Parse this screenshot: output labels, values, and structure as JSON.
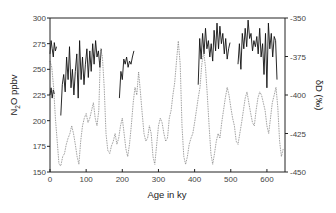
{
  "chart_data": {
    "type": "line",
    "title": "",
    "xlabel": "Age in ky",
    "ylabel": "N2O ppbv",
    "ylabel_right": "δD (‰)",
    "xlim": [
      0,
      650
    ],
    "ylim": [
      150,
      300
    ],
    "ylim_right": [
      -450,
      -350
    ],
    "x_ticks": [
      0,
      100,
      200,
      300,
      400,
      500,
      600
    ],
    "y_ticks": [
      150,
      175,
      200,
      225,
      250,
      275,
      300
    ],
    "y_ticks_right": [
      -350,
      -375,
      -400,
      -425,
      -450
    ],
    "grid": false,
    "legend": null,
    "series": [
      {
        "name": "N2O",
        "axis": "left",
        "style": "solid black",
        "segments": [
          {
            "x": [
              0,
              3,
              6,
              9,
              12,
              15,
              18
            ],
            "y": [
              265,
              278,
              270,
              262,
              276,
              268,
              272
            ]
          },
          {
            "x": [
              0,
              3,
              6,
              9,
              12
            ],
            "y": [
              225,
              232,
              222,
              230,
              226
            ]
          },
          {
            "x": [
              30,
              34,
              38,
              42,
              46,
              50,
              54,
              58,
              62,
              66,
              70,
              74,
              78,
              82,
              86,
              90,
              94,
              98,
              102,
              106,
              110,
              114,
              118,
              122,
              126,
              130,
              134,
              138,
              142
            ],
            "y": [
              205,
              235,
              245,
              228,
              262,
              240,
              272,
              232,
              250,
              225,
              248,
              265,
              222,
              278,
              240,
              262,
              235,
              255,
              270,
              242,
              268,
              248,
              275,
              255,
              278,
              262,
              268,
              252,
              270
            ]
          },
          {
            "x": [
              192,
              196,
              200,
              204,
              208,
              212,
              216,
              220,
              224,
              228,
              232
            ],
            "y": [
              222,
              248,
              240,
              260,
              255,
              262,
              252,
              258,
              255,
              262,
              268
            ]
          },
          {
            "x": [
              410,
              414,
              418,
              422,
              426,
              430,
              434,
              438,
              442,
              446,
              450,
              454,
              458,
              462,
              466,
              470,
              474,
              478,
              482,
              486,
              490,
              494,
              498
            ],
            "y": [
              235,
              280,
              260,
              285,
              265,
              290,
              270,
              278,
              262,
              275,
              258,
              288,
              268,
              295,
              270,
              292,
              275,
              285,
              265,
              280,
              260,
              270,
              276
            ]
          },
          {
            "x": [
              520,
              524,
              528,
              532,
              536,
              540,
              544,
              548,
              552,
              556,
              560,
              564,
              568,
              572,
              576,
              580,
              584,
              588,
              592,
              596,
              600,
              604,
              608,
              612,
              616,
              620,
              624,
              628
            ],
            "y": [
              255,
              275,
              250,
              285,
              270,
              290,
              272,
              298,
              280,
              285,
              268,
              278,
              272,
              282,
              265,
              290,
              262,
              275,
              245,
              285,
              232,
              295,
              270,
              285,
              262,
              282,
              278,
              240
            ]
          }
        ]
      },
      {
        "name": "δD",
        "axis": "right",
        "style": "dotted grey",
        "x": [
          0,
          5,
          10,
          15,
          20,
          25,
          30,
          35,
          40,
          45,
          50,
          55,
          60,
          65,
          70,
          75,
          80,
          85,
          90,
          95,
          100,
          105,
          110,
          115,
          120,
          125,
          130,
          135,
          140,
          145,
          150,
          155,
          160,
          165,
          170,
          175,
          180,
          185,
          190,
          195,
          200,
          205,
          210,
          215,
          220,
          225,
          230,
          235,
          240,
          245,
          250,
          255,
          260,
          265,
          270,
          275,
          280,
          285,
          290,
          295,
          300,
          305,
          310,
          315,
          320,
          325,
          330,
          335,
          340,
          345,
          350,
          355,
          360,
          365,
          370,
          375,
          380,
          385,
          390,
          395,
          400,
          405,
          410,
          415,
          420,
          425,
          430,
          435,
          440,
          445,
          450,
          455,
          460,
          465,
          470,
          475,
          480,
          485,
          490,
          495,
          500,
          505,
          510,
          515,
          520,
          525,
          530,
          535,
          540,
          545,
          550,
          555,
          560,
          565,
          570,
          575,
          580,
          585,
          590,
          595,
          600,
          605,
          610,
          615,
          620,
          625,
          630,
          635,
          640,
          645
        ],
        "y": [
          -378,
          -382,
          -395,
          -415,
          -430,
          -445,
          -446,
          -440,
          -438,
          -432,
          -428,
          -425,
          -420,
          -425,
          -432,
          -440,
          -445,
          -430,
          -420,
          -415,
          -412,
          -418,
          -415,
          -410,
          -405,
          -415,
          -420,
          -410,
          -370,
          -375,
          -395,
          -425,
          -436,
          -438,
          -433,
          -430,
          -425,
          -432,
          -428,
          -420,
          -415,
          -425,
          -435,
          -440,
          -432,
          -420,
          -405,
          -395,
          -400,
          -385,
          -398,
          -412,
          -425,
          -430,
          -428,
          -420,
          -425,
          -440,
          -445,
          -432,
          -420,
          -415,
          -418,
          -425,
          -430,
          -428,
          -415,
          -410,
          -400,
          -392,
          -378,
          -365,
          -380,
          -420,
          -440,
          -445,
          -440,
          -432,
          -428,
          -425,
          -418,
          -410,
          -402,
          -395,
          -380,
          -372,
          -382,
          -400,
          -420,
          -438,
          -445,
          -438,
          -430,
          -425,
          -428,
          -418,
          -410,
          -402,
          -395,
          -400,
          -408,
          -415,
          -420,
          -430,
          -432,
          -425,
          -418,
          -410,
          -402,
          -398,
          -405,
          -412,
          -418,
          -420,
          -410,
          -402,
          -398,
          -400,
          -405,
          -410,
          -420,
          -425,
          -415,
          -405,
          -400,
          -395,
          -408,
          -430,
          -440,
          -435
        ]
      }
    ]
  },
  "axes": {
    "x_title": "Age in ky",
    "y_left_title_main": "N",
    "y_left_title_sub": "2",
    "y_left_title_rest": "O ppbv",
    "y_right_title": "δD (‰)"
  }
}
